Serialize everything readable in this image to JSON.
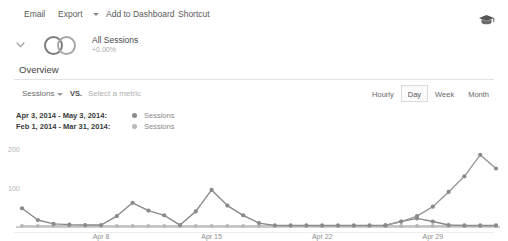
{
  "toolbar": {
    "email": "Email",
    "export": "Export",
    "add_to_dashboard": "Add to Dashboard",
    "shortcut": "Shortcut",
    "export_caret_icon": "chevron-down-icon",
    "academy_icon": "graduation-cap-icon"
  },
  "segment": {
    "expand_icon": "chevron-down-icon",
    "segment_icon": "two-circles-icon",
    "title": "All Sessions",
    "percent": "+0.00%"
  },
  "overview": {
    "heading": "Overview",
    "metric_primary": "Sessions",
    "metric_caret_icon": "chevron-down-icon",
    "vs_label": "VS.",
    "metric_secondary_placeholder": "Select a metric",
    "granularity": [
      {
        "label": "Hourly",
        "selected": false
      },
      {
        "label": "Day",
        "selected": true
      },
      {
        "label": "Week",
        "selected": false
      },
      {
        "label": "Month",
        "selected": false
      }
    ]
  },
  "legend": [
    {
      "range": "Apr 3, 2014 - May 3, 2014:",
      "metric": "Sessions",
      "color": "#8a8a8a"
    },
    {
      "range": "Feb 1, 2014 - Mar 31, 2014:",
      "metric": "Sessions",
      "color": "#b8b8b8"
    }
  ],
  "chart_data": {
    "type": "line",
    "title": "Overview",
    "xlabel": "",
    "ylabel": "",
    "ylim": [
      0,
      200
    ],
    "yticks": [
      100,
      200
    ],
    "ytick_labels": [
      "100",
      "200"
    ],
    "grid": false,
    "legend_position": "above-left",
    "x": [
      "Apr 3",
      "Apr 4",
      "Apr 5",
      "Apr 6",
      "Apr 7",
      "Apr 8",
      "Apr 9",
      "Apr 10",
      "Apr 11",
      "Apr 12",
      "Apr 13",
      "Apr 14",
      "Apr 15",
      "Apr 16",
      "Apr 17",
      "Apr 18",
      "Apr 19",
      "Apr 20",
      "Apr 21",
      "Apr 22",
      "Apr 23",
      "Apr 24",
      "Apr 25",
      "Apr 26",
      "Apr 27",
      "Apr 28",
      "Apr 29",
      "Apr 30",
      "May 1",
      "May 2",
      "May 3"
    ],
    "xtick_labels": [
      "Apr 8",
      "Apr 15",
      "Apr 22",
      "Apr 29"
    ],
    "xtick_indices": [
      5,
      12,
      19,
      26
    ],
    "series": [
      {
        "name": "Sessions",
        "range": "Apr 3, 2014 - May 3, 2014",
        "color": "#8a8a8a",
        "values": [
          48,
          18,
          8,
          6,
          5,
          5,
          28,
          62,
          42,
          30,
          5,
          40,
          95,
          55,
          30,
          10,
          4,
          4,
          4,
          4,
          4,
          4,
          4,
          4,
          14,
          22,
          14,
          5,
          4,
          4,
          4
        ]
      },
      {
        "name": "Sessions",
        "range": "Feb 1, 2014 - Mar 31, 2014",
        "color": "#b5b5b5",
        "values": [
          3,
          3,
          3,
          3,
          3,
          3,
          3,
          3,
          3,
          3,
          3,
          3,
          3,
          3,
          3,
          3,
          3,
          3,
          3,
          3,
          3,
          3,
          3,
          3,
          3,
          3,
          3,
          3,
          3,
          3,
          3
        ]
      }
    ],
    "annotations": [
      {
        "label": "peak",
        "x": "Apr 15",
        "y": 95
      },
      {
        "label": "late-spike-peak",
        "y": 185
      }
    ]
  }
}
